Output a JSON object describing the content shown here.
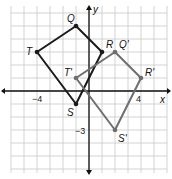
{
  "diagram": {
    "type": "coordinate-plane-translation",
    "axes": {
      "x_label": "x",
      "y_label": "y",
      "tick_labels": [
        {
          "axis": "x",
          "value": -4,
          "text": "−4"
        },
        {
          "axis": "x",
          "value": 4,
          "text": "4"
        },
        {
          "axis": "y",
          "value": -3,
          "text": "−3"
        }
      ],
      "x_range": [
        -6,
        6
      ],
      "y_range": [
        -6,
        6
      ]
    },
    "grid": true,
    "figures": [
      {
        "name": "QRST",
        "color": "#1a1a1a",
        "vertices": [
          {
            "label": "Q",
            "x": -1,
            "y": 5
          },
          {
            "label": "R",
            "x": 1,
            "y": 3
          },
          {
            "label": "S",
            "x": -1,
            "y": -1
          },
          {
            "label": "T",
            "x": -4,
            "y": 3
          }
        ]
      },
      {
        "name": "Q'R'S'T'",
        "color": "#6e6e6e",
        "vertices": [
          {
            "label": "Q'",
            "x": 2,
            "y": 3
          },
          {
            "label": "R'",
            "x": 4,
            "y": 1
          },
          {
            "label": "S'",
            "x": 2,
            "y": -3
          },
          {
            "label": "T'",
            "x": -1,
            "y": 1
          }
        ]
      }
    ]
  }
}
